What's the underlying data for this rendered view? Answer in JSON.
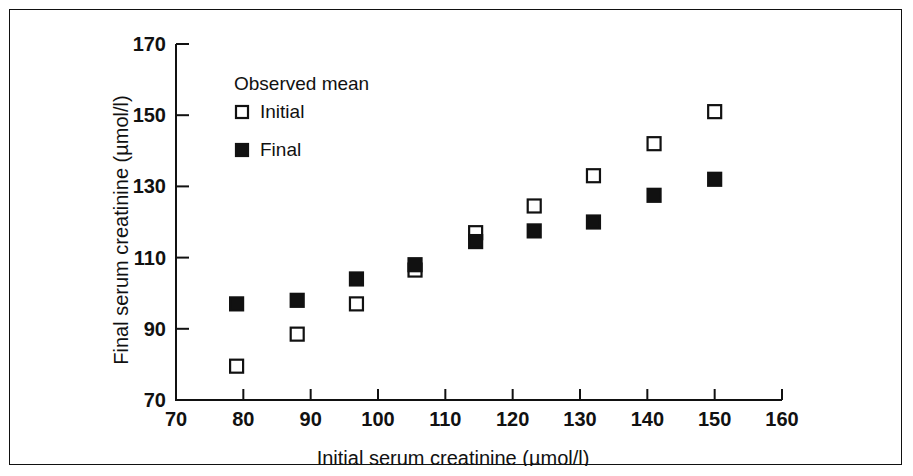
{
  "figure": {
    "border_color": "#111111",
    "background": "#ffffff"
  },
  "chart_data": {
    "type": "scatter",
    "title": "",
    "xlabel": "Initial serum creatinine (µmol/l)",
    "ylabel": "Final serum creatinine (µmol/l)",
    "xlim": [
      70,
      160
    ],
    "ylim": [
      70,
      170
    ],
    "xticks": [
      70,
      80,
      90,
      100,
      110,
      120,
      130,
      140,
      150,
      160
    ],
    "yticks": [
      70,
      90,
      110,
      130,
      150,
      170
    ],
    "xtick_labels": [
      "70",
      "80",
      "90",
      "100",
      "110",
      "120",
      "130",
      "140",
      "150",
      "160"
    ],
    "ytick_labels": [
      "70",
      "90",
      "110",
      "130",
      "150",
      "170"
    ],
    "grid": false,
    "legend_title": "Observed mean",
    "legend_position": "upper-left-inside",
    "series": [
      {
        "name": "Initial",
        "marker": "open-square",
        "marker_color": "#ffffff",
        "marker_edge_color": "#111111",
        "points": [
          {
            "x": 79.0,
            "y": 79.5
          },
          {
            "x": 88.0,
            "y": 88.5
          },
          {
            "x": 96.8,
            "y": 97.0
          },
          {
            "x": 105.5,
            "y": 106.5
          },
          {
            "x": 114.5,
            "y": 117.0
          },
          {
            "x": 123.2,
            "y": 124.5
          },
          {
            "x": 132.0,
            "y": 133.0
          },
          {
            "x": 141.0,
            "y": 142.0
          },
          {
            "x": 150.0,
            "y": 151.0
          }
        ]
      },
      {
        "name": "Final",
        "marker": "filled-square",
        "marker_color": "#111111",
        "marker_edge_color": "#111111",
        "points": [
          {
            "x": 79.0,
            "y": 97.0
          },
          {
            "x": 88.0,
            "y": 98.0
          },
          {
            "x": 96.8,
            "y": 104.0
          },
          {
            "x": 105.5,
            "y": 108.0
          },
          {
            "x": 114.5,
            "y": 114.5
          },
          {
            "x": 123.2,
            "y": 117.5
          },
          {
            "x": 132.0,
            "y": 120.0
          },
          {
            "x": 141.0,
            "y": 127.5
          },
          {
            "x": 150.0,
            "y": 132.0
          }
        ]
      }
    ]
  }
}
